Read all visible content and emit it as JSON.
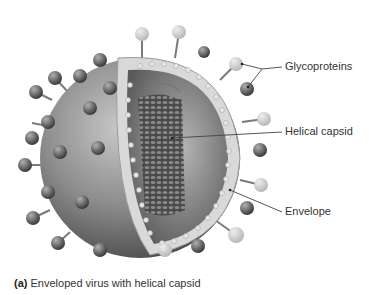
{
  "figure": {
    "type": "labeled-illustration",
    "labels": [
      {
        "id": "glycoproteins",
        "text": "Glycoproteins"
      },
      {
        "id": "helical-capsid",
        "text": "Helical capsid"
      },
      {
        "id": "envelope",
        "text": "Envelope"
      }
    ],
    "caption": {
      "marker": "(a)",
      "text": "Enveloped virus with helical capsid"
    }
  },
  "colors": {
    "text": "#333333",
    "leader_line": "#444444",
    "spike_dark": "#6e6e6e",
    "spike_light": "#cfcfcf",
    "sphere": "#8a8a8a"
  }
}
